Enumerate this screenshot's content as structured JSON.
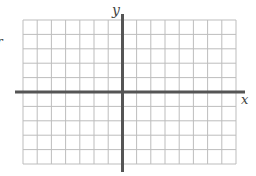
{
  "diagram": {
    "type": "coordinate-grid",
    "x_axis_label": "x",
    "y_axis_label": "y",
    "edge_fragment_text": "r",
    "grid": {
      "columns": 15,
      "rows": 10,
      "columns_left_of_y_axis": 7,
      "rows_above_x_axis": 5,
      "left": 23,
      "top": 20,
      "right": 236,
      "bottom": 164
    },
    "axes": {
      "x_axis": {
        "y": 92,
        "x_start": 15,
        "x_end": 245
      },
      "y_axis": {
        "x": 122.5,
        "y_start": 14,
        "y_end": 172
      }
    },
    "colors": {
      "grid_line": "#bdbdbd",
      "axis_line": "#555555",
      "label": "#444444",
      "background": "#ffffff"
    }
  }
}
